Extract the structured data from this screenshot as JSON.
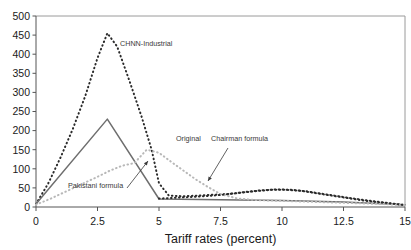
{
  "chart_data": {
    "type": "line",
    "title": "",
    "subtitle": "",
    "xlabel": "Tariff rates (percent)",
    "ylabel": "",
    "xlim": [
      0,
      15
    ],
    "ylim": [
      0,
      500
    ],
    "xticks": [
      "0",
      "2.5",
      "5",
      "7.5",
      "10",
      "12.5",
      "15"
    ],
    "xtick_values": [
      0,
      2.5,
      5,
      7.5,
      10,
      12.5,
      15
    ],
    "yticks": [
      "0",
      "50",
      "100",
      "150",
      "200",
      "250",
      "300",
      "350",
      "400",
      "450",
      "500"
    ],
    "ytick_values": [
      0,
      50,
      100,
      150,
      200,
      250,
      300,
      350,
      400,
      450,
      500
    ],
    "grid": false,
    "legend": "annotations",
    "series": [
      {
        "name": "CHNN-Industrial",
        "style": "dotted",
        "color": "#2b2b2b",
        "x": [
          0,
          0.5,
          1,
          1.5,
          2,
          2.5,
          2.9,
          3.3,
          3.8,
          4.3,
          4.7,
          5,
          5.4,
          6,
          6.6,
          7.2,
          7.8,
          8.4,
          9,
          9.6,
          10.2,
          10.8,
          11.4,
          12,
          12.6,
          13.2,
          13.8,
          14.4,
          15
        ],
        "y": [
          8,
          62,
          130,
          205,
          290,
          390,
          455,
          420,
          330,
          235,
          150,
          62,
          30,
          28,
          30,
          32,
          34,
          38,
          42,
          45,
          45,
          42,
          36,
          30,
          24,
          18,
          13,
          9,
          5
        ]
      },
      {
        "name": "Original",
        "style": "solid",
        "color": "#6e6e6e",
        "x": [
          0,
          2.9,
          5,
          7.5,
          10,
          12.5,
          15
        ],
        "y": [
          8,
          230,
          21,
          19,
          17,
          13,
          6
        ]
      },
      {
        "name": "Pakistani formula",
        "style": "dotted",
        "color": "#b8b8b8",
        "x": [
          0,
          0.6,
          1.2,
          1.8,
          2.4,
          3.0,
          3.5,
          4.0,
          4.5,
          5.0,
          5.5,
          6.0,
          6.5,
          7.0,
          7.5,
          8.2,
          9,
          10,
          11,
          12,
          13,
          14,
          15
        ],
        "y": [
          6,
          22,
          40,
          58,
          76,
          95,
          108,
          115,
          150,
          142,
          118,
          95,
          72,
          52,
          34,
          22,
          18,
          16,
          14,
          12,
          10,
          8,
          5
        ]
      },
      {
        "name": "Chairman formula",
        "style": "dotted",
        "color": "#2b2b2b",
        "x": [
          5,
          5.6,
          6.2,
          6.8,
          7.4,
          8,
          8.6,
          9.2,
          9.8,
          10.4,
          11,
          11.6,
          12.2,
          12.8,
          13.4,
          14,
          14.5,
          15
        ],
        "y": [
          22,
          24,
          26,
          28,
          31,
          35,
          40,
          44,
          46,
          45,
          41,
          35,
          29,
          23,
          18,
          13,
          9,
          5
        ]
      }
    ],
    "annotations": [
      {
        "label": "CHNN-Industrial",
        "x": 120,
        "y": 46,
        "arrow": false
      },
      {
        "label": "Original",
        "x": 176,
        "y": 141,
        "arrow": false
      },
      {
        "label": "Chairman formula",
        "x": 211,
        "y": 141,
        "arrow": true,
        "arrow_from": [
          228,
          148
        ],
        "arrow_to": [
          208,
          181
        ]
      },
      {
        "label": "Pakistani formula",
        "x": 68,
        "y": 188,
        "arrow": true,
        "arrow_from": [
          127,
          188
        ],
        "arrow_to": [
          148,
          161
        ]
      }
    ]
  }
}
